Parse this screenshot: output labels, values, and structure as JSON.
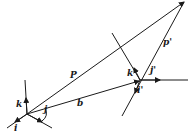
{
  "diagram": {
    "type": "vector-geometry",
    "labels": {
      "P": "P",
      "b": "b",
      "p_prime": "p'",
      "i": "i",
      "j": "j",
      "k": "k",
      "i_prime": "i'",
      "j_prime": "j'",
      "k_prime": "k'"
    },
    "colors": {
      "line": "#1a1a1a",
      "background": "#ffffff"
    }
  }
}
